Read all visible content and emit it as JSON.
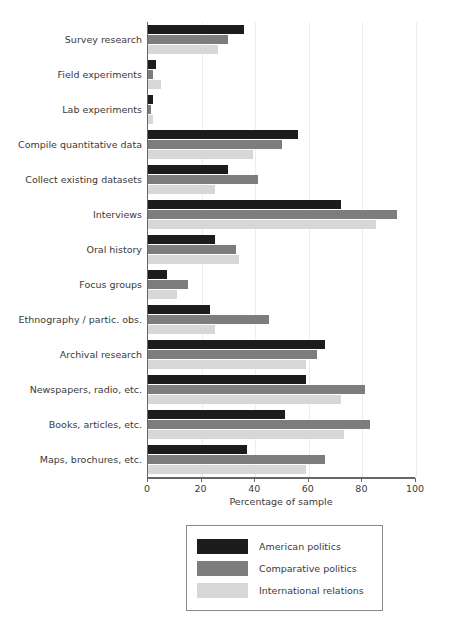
{
  "chart_data": {
    "type": "bar",
    "orientation": "horizontal",
    "title": "",
    "xlabel": "Percentage of sample",
    "ylabel": "",
    "xlim": [
      0,
      100
    ],
    "xticks": [
      0,
      20,
      40,
      60,
      80,
      100
    ],
    "grid": true,
    "legend_position": "below-plot",
    "categories": [
      "Survey research",
      "Field experiments",
      "Lab experiments",
      "Compile quantitative data",
      "Collect existing datasets",
      "Interviews",
      "Oral history",
      "Focus groups",
      "Ethnography / partic. obs.",
      "Archival research",
      "Newspapers, radio, etc.",
      "Books, articles, etc.",
      "Maps, brochures, etc."
    ],
    "series": [
      {
        "name": "American politics",
        "color": "#1c1c1c",
        "values": [
          36,
          3,
          2,
          56,
          30,
          72,
          25,
          7,
          23,
          66,
          59,
          51,
          37
        ]
      },
      {
        "name": "Comparative politics",
        "color": "#7d7d7d",
        "values": [
          30,
          2,
          1,
          50,
          41,
          93,
          33,
          15,
          45,
          63,
          81,
          83,
          66
        ]
      },
      {
        "name": "International relations",
        "color": "#d7d7d7",
        "values": [
          26,
          5,
          2,
          39,
          25,
          85,
          34,
          11,
          25,
          59,
          72,
          73,
          59
        ]
      }
    ]
  },
  "legend": {
    "items": [
      {
        "label": "American politics"
      },
      {
        "label": "Comparative politics"
      },
      {
        "label": "International relations"
      }
    ]
  }
}
